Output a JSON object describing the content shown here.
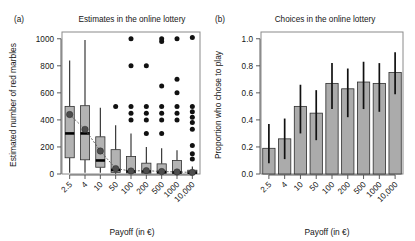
{
  "figure": {
    "panel_a_tag": "(a)",
    "panel_b_tag": "(b)"
  },
  "chart_data": [
    {
      "type": "box",
      "panel": "(a)",
      "title": "Estimates in the online lottery",
      "xlabel": "Payoff (in €)",
      "ylabel": "Estimated number of red marbles",
      "categories": [
        "2.5",
        "4",
        "10",
        "50",
        "100",
        "200",
        "500",
        "1000",
        "10,000"
      ],
      "ylim": [
        0,
        1050
      ],
      "yticks": [
        0,
        200,
        400,
        600,
        800,
        1000
      ],
      "ytick_labels": [
        "0",
        "200",
        "400",
        "600",
        "800",
        "1000"
      ],
      "grid": false,
      "legend": "none",
      "boxes": [
        {
          "category": "2.5",
          "min": 10,
          "q1": 120,
          "median": 300,
          "q3": 500,
          "max": 840,
          "mean": 440,
          "outliers": []
        },
        {
          "category": "4",
          "min": 10,
          "q1": 105,
          "median": 300,
          "q3": 505,
          "max": 990,
          "mean": 330,
          "outliers": []
        },
        {
          "category": "10",
          "min": 10,
          "q1": 50,
          "median": 100,
          "q3": 275,
          "max": 490,
          "mean": 170,
          "outliers": []
        },
        {
          "category": "50",
          "min": 2,
          "q1": 12,
          "median": 30,
          "q3": 180,
          "max": 360,
          "mean": 40,
          "outliers": [
            500
          ]
        },
        {
          "category": "100",
          "min": 1,
          "q1": 8,
          "median": 20,
          "q3": 130,
          "max": 300,
          "mean": 22,
          "outliers": [
            1000,
            800,
            500,
            450,
            400
          ]
        },
        {
          "category": "200",
          "min": 1,
          "q1": 6,
          "median": 20,
          "q3": 80,
          "max": 200,
          "mean": 25,
          "outliers": [
            800,
            500,
            450,
            400,
            300
          ]
        },
        {
          "category": "500",
          "min": 1,
          "q1": 5,
          "median": 15,
          "q3": 75,
          "max": 190,
          "mean": 18,
          "outliers": [
            1000,
            980,
            650,
            500,
            450,
            400,
            300
          ]
        },
        {
          "category": "1000",
          "min": 1,
          "q1": 5,
          "median": 12,
          "q3": 100,
          "max": 175,
          "mean": 15,
          "outliers": [
            1000,
            700,
            600,
            500,
            450,
            400
          ]
        },
        {
          "category": "10,000",
          "min": 1,
          "q1": 4,
          "median": 10,
          "q3": 28,
          "max": 55,
          "mean": 12,
          "outliers": [
            1010,
            500,
            460,
            420,
            380,
            330,
            210,
            150,
            110
          ]
        }
      ]
    },
    {
      "type": "bar",
      "panel": "(b)",
      "title": "Choices in the online lottery",
      "xlabel": "Payoff (in €)",
      "ylabel": "Proportion who chose to play",
      "categories": [
        "2.5",
        "4",
        "10",
        "50",
        "100",
        "200",
        "500",
        "1000",
        "10,000"
      ],
      "values": [
        0.19,
        0.26,
        0.5,
        0.45,
        0.67,
        0.63,
        0.68,
        0.67,
        0.75
      ],
      "err_low": [
        0.08,
        0.11,
        0.3,
        0.25,
        0.48,
        0.42,
        0.48,
        0.46,
        0.59
      ],
      "err_high": [
        0.37,
        0.41,
        0.66,
        0.62,
        0.82,
        0.78,
        0.83,
        0.82,
        0.9
      ],
      "ylim": [
        0,
        1.05
      ],
      "yticks": [
        0.0,
        0.2,
        0.4,
        0.6,
        0.8,
        1.0
      ],
      "ytick_labels": [
        "0.0",
        "0.2",
        "0.4",
        "0.6",
        "0.8",
        "1.0"
      ],
      "grid": false,
      "legend": "none"
    }
  ]
}
